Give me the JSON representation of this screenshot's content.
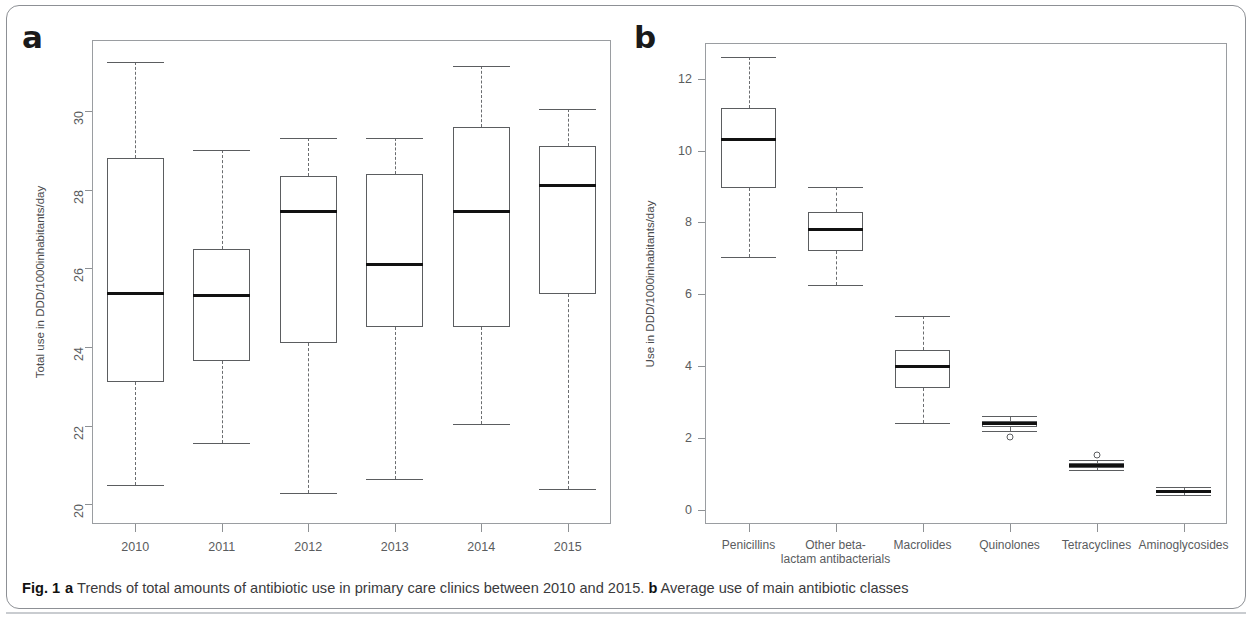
{
  "figure": {
    "caption_prefix": "Fig. 1",
    "caption_a_marker": "a",
    "caption_a_text": " Trends of total amounts of antibiotic use in primary care clinics between 2010 and 2015. ",
    "caption_b_marker": "b",
    "caption_b_text": " Average use of main antibiotic classes",
    "panel_a_letter": "a",
    "panel_b_letter": "b",
    "line_color": "#5b5d60",
    "median_color": "#111111",
    "frame_color": "#8d9095",
    "tick_label_color": "#5a5c5e"
  },
  "chart_data": [
    {
      "type": "box",
      "panel": "a",
      "title": "Trends of total amounts of antibiotic use in primary care clinics between 2010 and 2015",
      "xlabel": "",
      "ylabel": "Total use in DDD/1000inhabitants/day",
      "ylim": [
        19.5,
        31.8
      ],
      "yticks": [
        20,
        22,
        24,
        26,
        28,
        30
      ],
      "ytick_labels": [
        "20",
        "22",
        "24",
        "26",
        "28",
        "30"
      ],
      "grid": false,
      "legend": "none",
      "categories": [
        "2010",
        "2011",
        "2012",
        "2013",
        "2014",
        "2015"
      ],
      "boxes": [
        {
          "label": "2010",
          "whisker_low": 20.5,
          "q1": 23.1,
          "median": 25.35,
          "q3": 28.8,
          "whisker_high": 31.25,
          "outliers": []
        },
        {
          "label": "2011",
          "whisker_low": 21.55,
          "q1": 23.65,
          "median": 25.3,
          "q3": 26.5,
          "whisker_high": 29.0,
          "outliers": []
        },
        {
          "label": "2012",
          "whisker_low": 20.3,
          "q1": 24.1,
          "median": 27.45,
          "q3": 28.35,
          "whisker_high": 29.3,
          "outliers": []
        },
        {
          "label": "2013",
          "whisker_low": 20.65,
          "q1": 24.5,
          "median": 26.1,
          "q3": 28.4,
          "whisker_high": 29.3,
          "outliers": []
        },
        {
          "label": "2014",
          "whisker_low": 22.05,
          "q1": 24.5,
          "median": 27.45,
          "q3": 29.6,
          "whisker_high": 31.15,
          "outliers": []
        },
        {
          "label": "2015",
          "whisker_low": 20.4,
          "q1": 25.35,
          "median": 28.1,
          "q3": 29.1,
          "whisker_high": 30.05,
          "outliers": []
        }
      ]
    },
    {
      "type": "box",
      "panel": "b",
      "title": "Average use of main antibiotic classes",
      "xlabel": "",
      "ylabel": "Use in DDD/1000inhabitants/day",
      "ylim": [
        -0.4,
        13.0
      ],
      "yticks": [
        0,
        2,
        4,
        6,
        8,
        10,
        12
      ],
      "ytick_labels": [
        "0",
        "2",
        "4",
        "6",
        "8",
        "10",
        "12"
      ],
      "grid": false,
      "legend": "none",
      "categories": [
        "Penicillins",
        "Other beta-lactam antibacterials",
        "Macrolides",
        "Quinolones",
        "Tetracyclines",
        "Aminoglycosides"
      ],
      "category_lines": [
        [
          "Penicillins"
        ],
        [
          "Other beta-",
          "lactam antibacterials"
        ],
        [
          "Macrolides"
        ],
        [
          "Quinolones"
        ],
        [
          "Tetracyclines"
        ],
        [
          "Aminoglycosides"
        ]
      ],
      "boxes": [
        {
          "label": "Penicillins",
          "whisker_low": 7.05,
          "q1": 8.95,
          "median": 10.3,
          "q3": 11.2,
          "whisker_high": 12.6,
          "outliers": []
        },
        {
          "label": "Other beta-lactam antibacterials",
          "whisker_low": 6.25,
          "q1": 7.2,
          "median": 7.8,
          "q3": 8.3,
          "whisker_high": 9.0,
          "outliers": []
        },
        {
          "label": "Macrolides",
          "whisker_low": 2.4,
          "q1": 3.4,
          "median": 3.98,
          "q3": 4.45,
          "whisker_high": 5.4,
          "outliers": []
        },
        {
          "label": "Quinolones",
          "whisker_low": 2.2,
          "q1": 2.3,
          "median": 2.4,
          "q3": 2.48,
          "whisker_high": 2.6,
          "outliers": [
            2.03
          ]
        },
        {
          "label": "Tetracyclines",
          "whisker_low": 1.1,
          "q1": 1.17,
          "median": 1.24,
          "q3": 1.3,
          "whisker_high": 1.38,
          "outliers": [
            1.52
          ]
        },
        {
          "label": "Aminoglycosides",
          "whisker_low": 0.4,
          "q1": 0.45,
          "median": 0.5,
          "q3": 0.55,
          "whisker_high": 0.62,
          "outliers": []
        }
      ]
    }
  ]
}
